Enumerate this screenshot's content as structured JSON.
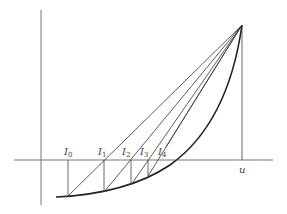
{
  "diagram": {
    "type": "geometric construction",
    "axes": {
      "x_axis": true,
      "y_axis": true
    },
    "apex_label": "",
    "end_label": "u",
    "iterate_labels": [
      {
        "base": "I",
        "sub": "0"
      },
      {
        "base": "I",
        "sub": "1"
      },
      {
        "base": "I",
        "sub": "2"
      },
      {
        "base": "I",
        "sub": "3"
      },
      {
        "base": "I",
        "sub": "4"
      }
    ],
    "colors": {
      "line": "#333333",
      "curve": "#222222",
      "axis": "#555555"
    }
  }
}
